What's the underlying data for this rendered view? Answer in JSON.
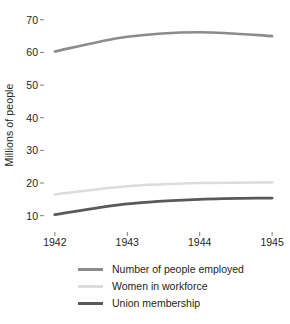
{
  "chart_data": {
    "type": "line",
    "title": "",
    "subtitle": "",
    "xlabel": "",
    "ylabel": "Millions of people",
    "x": [
      1942,
      1943,
      1944,
      1945
    ],
    "xticklabels": [
      "1942",
      "1943",
      "1944",
      "1945"
    ],
    "yticks": [
      10,
      20,
      30,
      40,
      50,
      60,
      70
    ],
    "yticklabels": [
      "10",
      "20",
      "30",
      "40",
      "50",
      "60",
      "70"
    ],
    "ylim": [
      5,
      73
    ],
    "xlim": [
      1941.85,
      1945.15
    ],
    "grid": false,
    "legend_position": "below-plot-left",
    "series": [
      {
        "name": "Number of people employed",
        "color": "#8c8c8c",
        "width": 2.6,
        "values": [
          60.3,
          64.8,
          66.2,
          65.0
        ]
      },
      {
        "name": "Women in workforce",
        "color": "#dcdcdc",
        "width": 2.6,
        "values": [
          16.5,
          19.0,
          20.0,
          20.2
        ]
      },
      {
        "name": "Union membership",
        "color": "#58595b",
        "width": 2.8,
        "values": [
          10.3,
          13.6,
          15.0,
          15.4
        ]
      }
    ]
  },
  "axes": {
    "y_title": "Millions of people"
  },
  "legend": {
    "items": [
      {
        "label": "Number of people employed"
      },
      {
        "label": "Women in workforce"
      },
      {
        "label": "Union membership"
      }
    ]
  }
}
